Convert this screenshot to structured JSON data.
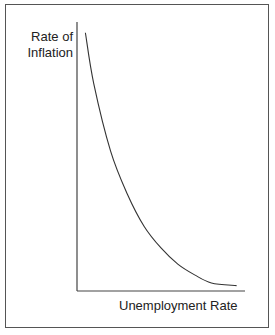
{
  "chart_data": {
    "type": "line",
    "title": "",
    "xlabel": "Unemployment Rate",
    "ylabel": "Rate of Inflation",
    "ylabel_lines": [
      "Rate of",
      "Inflation"
    ],
    "series": [
      {
        "name": "Phillips curve",
        "x": [
          0.05,
          0.1,
          0.2,
          0.3,
          0.4,
          0.5,
          0.6,
          0.7,
          0.8,
          0.95
        ],
        "y": [
          0.96,
          0.77,
          0.52,
          0.36,
          0.24,
          0.16,
          0.1,
          0.06,
          0.03,
          0.02
        ]
      }
    ],
    "xticks": [],
    "yticks": [],
    "grid": false,
    "legend": "none",
    "xlim": [
      0,
      1
    ],
    "ylim": [
      0,
      1
    ]
  },
  "colors": {
    "line": "#333333",
    "axis": "#444444",
    "frame": "#555555"
  }
}
